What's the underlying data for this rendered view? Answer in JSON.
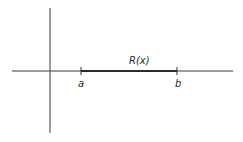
{
  "diagram": {
    "function_label": "R(x)",
    "point_a_label": "a",
    "point_b_label": "b",
    "colors": {
      "ink": "#2a2a2a",
      "background": "#ffffff"
    }
  }
}
